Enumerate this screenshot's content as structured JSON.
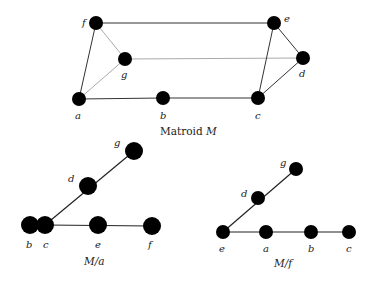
{
  "figure": {
    "matroid_M": {
      "caption_text": "Matroid ",
      "caption_symbol": "M",
      "nodes": [
        {
          "id": "f",
          "label": "f",
          "x": 96,
          "y": 23,
          "r": 7,
          "lx": -14,
          "ly": 3
        },
        {
          "id": "e",
          "label": "e",
          "x": 274,
          "y": 23,
          "r": 7,
          "lx": 10,
          "ly": -1
        },
        {
          "id": "g",
          "label": "g",
          "x": 125,
          "y": 59,
          "r": 7,
          "lx": -4,
          "ly": 19
        },
        {
          "id": "d",
          "label": "d",
          "x": 303,
          "y": 58,
          "r": 7,
          "lx": -4,
          "ly": 19
        },
        {
          "id": "a",
          "label": "a",
          "x": 79,
          "y": 99,
          "r": 7,
          "lx": -4,
          "ly": 20
        },
        {
          "id": "b",
          "label": "b",
          "x": 163,
          "y": 98,
          "r": 7,
          "lx": -3,
          "ly": 21
        },
        {
          "id": "c",
          "label": "c",
          "x": 258,
          "y": 98,
          "r": 7,
          "lx": -3,
          "ly": 21
        }
      ],
      "edges": [
        {
          "from": "f",
          "to": "e",
          "color": "#333",
          "w": 1
        },
        {
          "from": "f",
          "to": "a",
          "color": "#333",
          "w": 1
        },
        {
          "from": "f",
          "to": "g",
          "color": "#aaa",
          "w": 1
        },
        {
          "from": "g",
          "to": "a",
          "color": "#aaa",
          "w": 1
        },
        {
          "from": "g",
          "to": "d",
          "color": "#aaa",
          "w": 1
        },
        {
          "from": "a",
          "to": "b",
          "color": "#333",
          "w": 1
        },
        {
          "from": "b",
          "to": "c",
          "color": "#333",
          "w": 1
        },
        {
          "from": "e",
          "to": "c",
          "color": "#333",
          "w": 1
        },
        {
          "from": "e",
          "to": "d",
          "color": "#333",
          "w": 1
        },
        {
          "from": "d",
          "to": "c",
          "color": "#333",
          "w": 1
        }
      ],
      "caption_x": 160,
      "caption_y": 135
    },
    "contraction_a": {
      "caption_text": "M/a",
      "nodes": [
        {
          "id": "g",
          "label": "g",
          "x": 134,
          "y": 151,
          "r": 9,
          "lx": -20,
          "ly": -5
        },
        {
          "id": "d",
          "label": "d",
          "x": 88,
          "y": 186,
          "r": 9,
          "lx": -20,
          "ly": -4
        },
        {
          "id": "b",
          "label": "b",
          "x": 30,
          "y": 225,
          "r": 9,
          "lx": -4,
          "ly": 23
        },
        {
          "id": "c",
          "label": "c",
          "x": 45,
          "y": 225,
          "r": 9,
          "lx": -2,
          "ly": 23
        },
        {
          "id": "e",
          "label": "e",
          "x": 98,
          "y": 225,
          "r": 9,
          "lx": -3,
          "ly": 23
        },
        {
          "id": "f",
          "label": "f",
          "x": 152,
          "y": 226,
          "r": 9,
          "lx": -4,
          "ly": 22
        }
      ],
      "edges": [
        {
          "from": "c",
          "to": "g",
          "color": "#222",
          "w": 1.2
        },
        {
          "from": "c",
          "to": "f",
          "color": "#222",
          "w": 1.2
        }
      ],
      "caption_x": 84,
      "caption_y": 265
    },
    "contraction_f": {
      "caption_text": "M/f",
      "nodes": [
        {
          "id": "g",
          "label": "g",
          "x": 296,
          "y": 169,
          "r": 7,
          "lx": -16,
          "ly": -3
        },
        {
          "id": "d",
          "label": "d",
          "x": 258,
          "y": 198,
          "r": 7,
          "lx": -17,
          "ly": -1
        },
        {
          "id": "e",
          "label": "e",
          "x": 223,
          "y": 232,
          "r": 7,
          "lx": -4,
          "ly": 20
        },
        {
          "id": "a",
          "label": "a",
          "x": 266,
          "y": 232,
          "r": 7,
          "lx": -3,
          "ly": 20
        },
        {
          "id": "b",
          "label": "b",
          "x": 311,
          "y": 232,
          "r": 7,
          "lx": -3,
          "ly": 20
        },
        {
          "id": "c",
          "label": "c",
          "x": 349,
          "y": 232,
          "r": 7,
          "lx": -3,
          "ly": 20
        }
      ],
      "edges": [
        {
          "from": "e",
          "to": "g",
          "color": "#222",
          "w": 1.2
        },
        {
          "from": "e",
          "to": "c",
          "color": "#222",
          "w": 1.2
        }
      ],
      "caption_x": 274,
      "caption_y": 267
    }
  }
}
